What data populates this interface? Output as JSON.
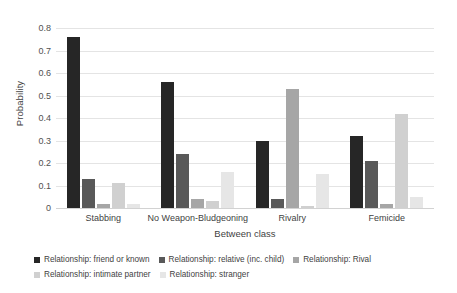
{
  "chart_data": {
    "type": "bar",
    "title": "",
    "xlabel": "Between class",
    "ylabel": "Probability",
    "categories": [
      "Stabbing",
      "No Weapon-Bludgeoning",
      "Rivalry",
      "Femicide"
    ],
    "ylim": [
      0,
      0.8
    ],
    "ytick_labels": [
      "0",
      "0.1",
      "0.2",
      "0.3",
      "0.4",
      "0.5",
      "0.6",
      "0.7",
      "0.8"
    ],
    "ytick_values": [
      0,
      0.1,
      0.2,
      0.3,
      0.4,
      0.5,
      0.6,
      0.7,
      0.8
    ],
    "grid": true,
    "legend_position": "bottom-left",
    "series": [
      {
        "name": "Relationship: friend or known",
        "color": "#262626",
        "values": [
          0.76,
          0.56,
          0.3,
          0.32
        ]
      },
      {
        "name": "Relationship: relative (inc. child)",
        "color": "#595959",
        "values": [
          0.13,
          0.24,
          0.04,
          0.21
        ]
      },
      {
        "name": "Relationship: Rival",
        "color": "#a6a6a6",
        "values": [
          0.02,
          0.04,
          0.53,
          0.02
        ]
      },
      {
        "name": "Relationship: intimate partner",
        "color": "#d0d0d0",
        "values": [
          0.11,
          0.03,
          0.01,
          0.42
        ]
      },
      {
        "name": "Relationship: stranger",
        "color": "#e6e6e6",
        "values": [
          0.02,
          0.16,
          0.15,
          0.05
        ]
      }
    ]
  }
}
